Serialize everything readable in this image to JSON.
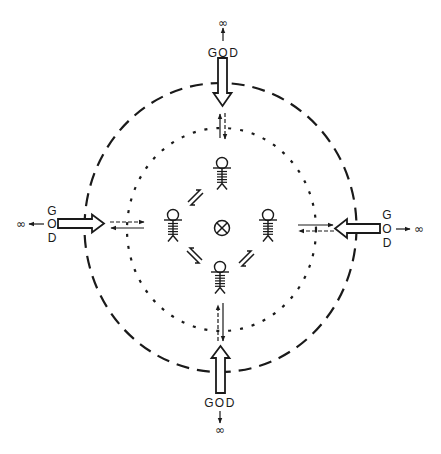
{
  "colors": {
    "ink": "#1a1a1a",
    "background": "#ffffff"
  },
  "rings": [
    {
      "id": "outer-ring",
      "style": "dashed"
    },
    {
      "id": "inner-ring",
      "style": "dotted"
    }
  ],
  "center": {
    "symbol": "⊗",
    "icon": "circled-x-icon"
  },
  "figures": [
    {
      "position": "top",
      "icon": "stick-figure-icon"
    },
    {
      "position": "left",
      "icon": "stick-figure-icon"
    },
    {
      "position": "right",
      "icon": "stick-figure-icon"
    },
    {
      "position": "bottom",
      "icon": "stick-figure-icon"
    }
  ],
  "labels": {
    "top": {
      "g": "G",
      "o": "O",
      "d": "D",
      "infinity": "∞"
    },
    "bottom": {
      "g": "G",
      "o": "O",
      "d": "D",
      "infinity": "∞"
    },
    "left": {
      "g": "G",
      "o": "O",
      "d": "D",
      "infinity": "∞"
    },
    "right": {
      "g": "G",
      "o": "O",
      "d": "D",
      "infinity": "∞"
    }
  }
}
